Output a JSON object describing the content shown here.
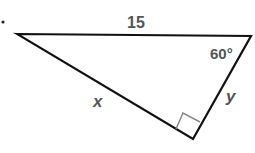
{
  "diagram": {
    "type": "right-triangle",
    "marker_dot": "•",
    "hypotenuse_label": "15",
    "angle_label": "60°",
    "leg_x_label": "x",
    "leg_y_label": "y",
    "vertices": {
      "left": [
        17,
        34
      ],
      "right": [
        251,
        36
      ],
      "bottom": [
        193,
        139
      ]
    },
    "right_angle_at": "bottom",
    "colors": {
      "stroke": "#111111",
      "label": "#555555",
      "right_angle_mark": "#888888"
    }
  }
}
